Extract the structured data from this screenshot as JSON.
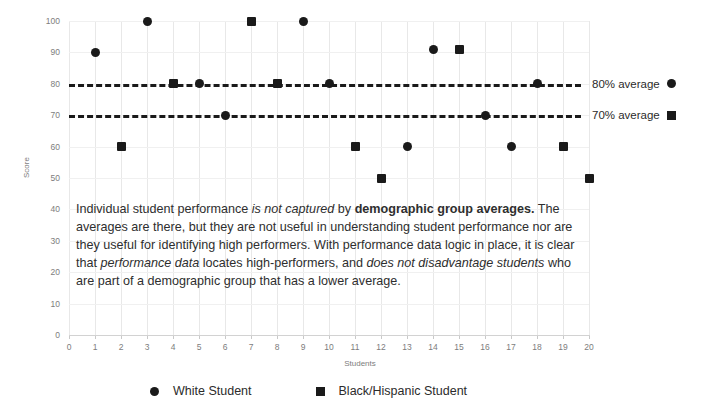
{
  "chart_data": {
    "type": "scatter",
    "title": "",
    "xlabel": "Students",
    "ylabel": "Score",
    "xlim": [
      0,
      20
    ],
    "ylim": [
      0,
      100
    ],
    "xticks": [
      0,
      1,
      2,
      3,
      4,
      5,
      6,
      7,
      8,
      9,
      10,
      11,
      12,
      13,
      14,
      15,
      16,
      17,
      18,
      19,
      20
    ],
    "yticks": [
      0,
      10,
      20,
      30,
      40,
      50,
      60,
      70,
      80,
      90,
      100
    ],
    "grid": true,
    "legend_position": "bottom",
    "series": [
      {
        "name": "White Student",
        "marker": "circle",
        "color": "#1a1a1a",
        "points": [
          {
            "x": 1,
            "y": 90
          },
          {
            "x": 3,
            "y": 100
          },
          {
            "x": 5,
            "y": 80
          },
          {
            "x": 6,
            "y": 70
          },
          {
            "x": 9,
            "y": 100
          },
          {
            "x": 10,
            "y": 80
          },
          {
            "x": 13,
            "y": 60
          },
          {
            "x": 14,
            "y": 91
          },
          {
            "x": 16,
            "y": 70
          },
          {
            "x": 17,
            "y": 60
          },
          {
            "x": 18,
            "y": 80
          }
        ]
      },
      {
        "name": "Black/Hispanic Student",
        "marker": "square",
        "color": "#1a1a1a",
        "points": [
          {
            "x": 2,
            "y": 60
          },
          {
            "x": 4,
            "y": 80
          },
          {
            "x": 7,
            "y": 100
          },
          {
            "x": 8,
            "y": 80
          },
          {
            "x": 11,
            "y": 60
          },
          {
            "x": 12,
            "y": 50
          },
          {
            "x": 15,
            "y": 91
          },
          {
            "x": 19,
            "y": 60
          },
          {
            "x": 20,
            "y": 50
          }
        ]
      }
    ],
    "reference_lines": [
      {
        "value": 80,
        "label": "80% average",
        "glyph": "circle",
        "style": "dashed"
      },
      {
        "value": 70,
        "label": "70% average",
        "glyph": "square",
        "style": "dashed"
      }
    ],
    "annotations": [
      {
        "id": "overlay-paragraph",
        "text": "Individual student performance is not captured by demographic group averages. The averages are there, but they are not useful in understanding student performance nor are they useful for identifying high performers. With performance data logic in place, it is clear that performance data locates high-performers, and does not disadvantage students who are part of a demographic group that has a lower average."
      }
    ]
  },
  "axes": {
    "y_title": "Score",
    "x_title": "Students",
    "y_tick_labels": [
      "0",
      "10",
      "20",
      "30",
      "40",
      "50",
      "60",
      "70",
      "80",
      "90",
      "100"
    ],
    "x_tick_labels": [
      "0",
      "1",
      "2",
      "3",
      "4",
      "5",
      "6",
      "7",
      "8",
      "9",
      "10",
      "11",
      "12",
      "13",
      "14",
      "15",
      "16",
      "17",
      "18",
      "19",
      "20"
    ]
  },
  "reference_labels": {
    "line_80": "80% average",
    "line_70": "70% average"
  },
  "legend": {
    "items": [
      {
        "label": "White Student",
        "marker": "circle"
      },
      {
        "label": "Black/Hispanic Student",
        "marker": "square"
      }
    ]
  },
  "annotation": {
    "seg1": "Individual student performance ",
    "seg2_italic": "is not captured",
    "seg3": " by ",
    "seg4_bold": "demographic group averages.",
    "seg5": " The averages are there, but they are not useful in understanding student performance nor are they useful for identifying high performers. With performance data logic in place, it is clear that ",
    "seg6_italic": "performance data",
    "seg7": " locates high-performers, and ",
    "seg8_italic": "does not disadvantage students",
    "seg9": " who are part of a demographic group that has a lower average."
  },
  "colors": {
    "marker": "#1a1a1a",
    "grid": "#e8e8e8",
    "text": "#2e2e2e",
    "tick": "#7d7d7d"
  }
}
